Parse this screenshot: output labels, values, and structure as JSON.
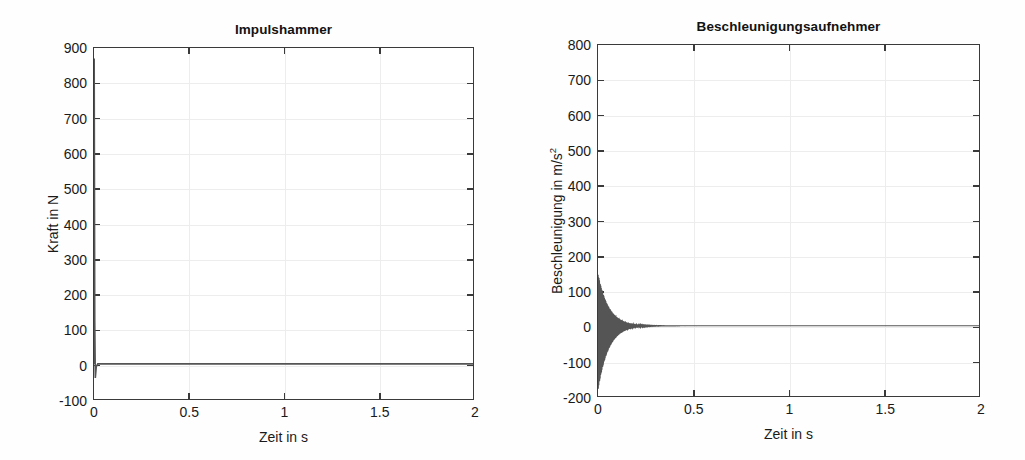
{
  "figure": {
    "background_color": "#ffffff",
    "trace_color": "#555555",
    "axis_color": "#3a3a3a",
    "grid_color": "#ededed"
  },
  "chart_data": [
    {
      "type": "line",
      "id": "impulshammer",
      "title": "Impulshammer",
      "xlabel": "Zeit in s",
      "ylabel": "Kraft in N",
      "xlim": [
        0,
        2
      ],
      "ylim": [
        -100,
        900
      ],
      "xticks": [
        0,
        0.5,
        1,
        1.5,
        2
      ],
      "xticklabels": [
        "0",
        "0.5",
        "1",
        "1.5",
        "2"
      ],
      "yticks": [
        -100,
        0,
        100,
        200,
        300,
        400,
        500,
        600,
        700,
        800,
        900
      ],
      "yticklabels": [
        "-100",
        "0",
        "100",
        "200",
        "300",
        "400",
        "500",
        "600",
        "700",
        "800",
        "900"
      ],
      "grid": true,
      "legend": "none",
      "description": "Force impulse from hammer strike: single narrow spike at t=0 reaching about 870 N, small negative undershoot to about -40 N, then flat at 0 N for the rest of the 2 s record.",
      "series": [
        {
          "name": "Kraft",
          "peak_value": 870,
          "peak_time": 0.0,
          "undershoot_value": -40,
          "baseline_value": 0,
          "points": [
            [
              0.0,
              0
            ],
            [
              0.001,
              870
            ],
            [
              0.004,
              120
            ],
            [
              0.007,
              -40
            ],
            [
              0.012,
              -8
            ],
            [
              0.02,
              0
            ],
            [
              0.5,
              0
            ],
            [
              1.0,
              0
            ],
            [
              1.5,
              0
            ],
            [
              2.0,
              0
            ]
          ]
        }
      ]
    },
    {
      "type": "line",
      "id": "beschleunigungsaufnehmer",
      "title": "Beschleunigungsaufnehmer",
      "xlabel": "Zeit in s",
      "ylabel": "Beschleunigung in m/s²",
      "xlim": [
        0,
        2
      ],
      "ylim": [
        -200,
        800
      ],
      "xticks": [
        0,
        0.5,
        1,
        1.5,
        2
      ],
      "xticklabels": [
        "0",
        "0.5",
        "1",
        "1.5",
        "2"
      ],
      "yticks": [
        -200,
        -100,
        0,
        100,
        200,
        300,
        400,
        500,
        600,
        700,
        800
      ],
      "yticklabels": [
        "-200",
        "-100",
        "0",
        "100",
        "200",
        "300",
        "400",
        "500",
        "600",
        "700",
        "800"
      ],
      "grid": true,
      "legend": "none",
      "description": "Accelerometer response: exponentially decaying high-frequency oscillation starting at about +150 / -185 m/s^2 at t=0, envelope decaying to near zero by t about 0.25 s, then flat at 0 m/s^2 to t = 2 s.",
      "series": [
        {
          "name": "Beschleunigung",
          "envelope_initial_positive": 150,
          "envelope_initial_negative": -185,
          "decay_time_constant_s": 0.055,
          "oscillation_frequency_hz": 420,
          "baseline_value": 0,
          "envelope_points": [
            [
              0.0,
              150
            ],
            [
              0.01,
              126
            ],
            [
              0.02,
              105
            ],
            [
              0.04,
              74
            ],
            [
              0.06,
              51
            ],
            [
              0.08,
              35
            ],
            [
              0.1,
              24
            ],
            [
              0.14,
              12
            ],
            [
              0.18,
              6
            ],
            [
              0.22,
              3
            ],
            [
              0.3,
              1
            ],
            [
              0.5,
              0
            ],
            [
              1.0,
              0
            ],
            [
              1.5,
              0
            ],
            [
              2.0,
              0
            ]
          ]
        }
      ]
    }
  ]
}
